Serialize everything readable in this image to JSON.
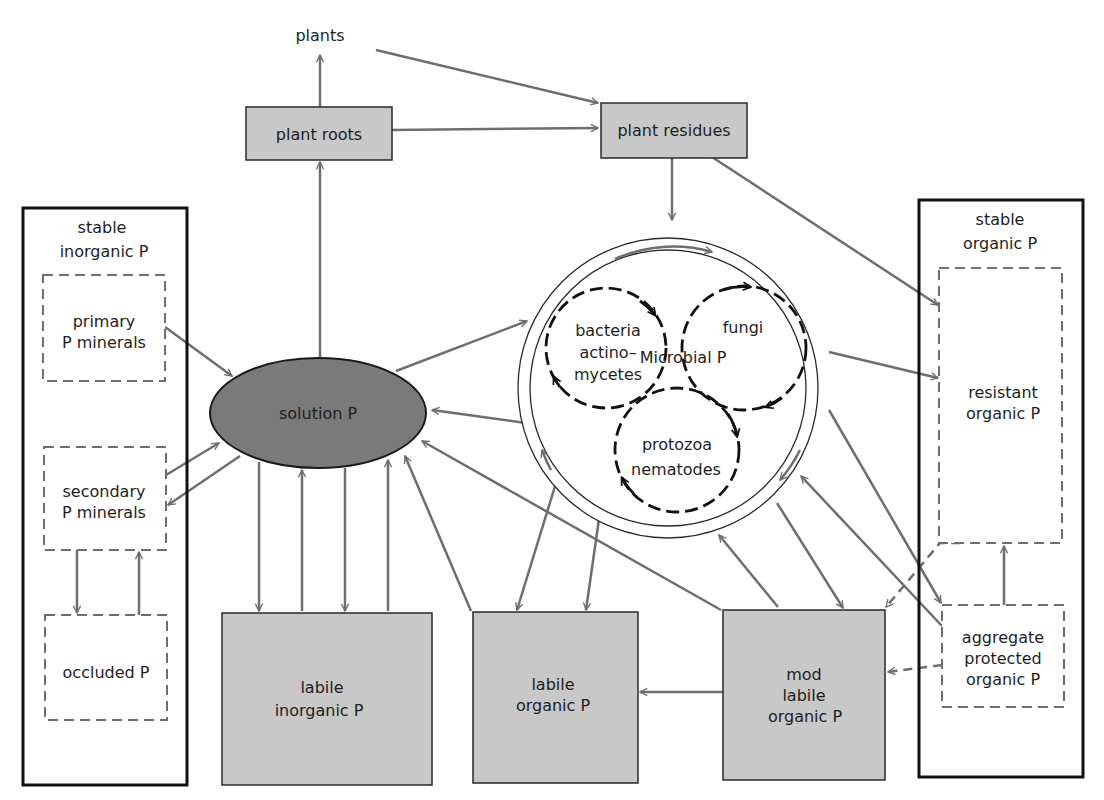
{
  "diagram": {
    "type": "soil phosphorus cycle flow diagram",
    "colors": {
      "pool_fill": "#c8c8c8",
      "solution_fill": "#7a7a7a",
      "arrow": "#6e6e6e",
      "border": "#111111"
    },
    "nodes": {
      "plants": {
        "label": "plants"
      },
      "plant_roots": {
        "label": "plant roots"
      },
      "plant_residues": {
        "label": "plant residues"
      },
      "stable_inorganic": {
        "line1": "stable",
        "line2": "inorganic P"
      },
      "primary_minerals": {
        "line1": "primary",
        "line2": "P minerals"
      },
      "secondary_minerals": {
        "line1": "secondary",
        "line2": "P minerals"
      },
      "occluded": {
        "label": "occluded P"
      },
      "solution": {
        "label": "solution P"
      },
      "labile_inorganic": {
        "line1": "labile",
        "line2": "inorganic P"
      },
      "labile_organic": {
        "line1": "labile",
        "line2": "organic P"
      },
      "mod_labile_organic": {
        "line1": "mod",
        "line2": "labile",
        "line3": "organic P"
      },
      "stable_organic": {
        "line1": "stable",
        "line2": "organic P"
      },
      "resistant_organic": {
        "line1": "resistant",
        "line2": "organic P"
      },
      "aggregate_protected": {
        "line1": "aggregate",
        "line2": "protected",
        "line3": "organic P"
      },
      "microbial": {
        "label": "Microbial P",
        "bacteria": {
          "line1": "bacteria",
          "line2": "actino–",
          "line3": "mycetes"
        },
        "fungi": {
          "label": "fungi"
        },
        "protozoa": {
          "line1": "protozoa",
          "line2": "nematodes"
        }
      }
    },
    "edges": [
      {
        "from": "plant roots",
        "to": "plants"
      },
      {
        "from": "plants",
        "to": "plant residues"
      },
      {
        "from": "plant roots",
        "to": "plant residues"
      },
      {
        "from": "solution P",
        "to": "plant roots"
      },
      {
        "from": "plant residues",
        "to": "Microbial P"
      },
      {
        "from": "plant residues",
        "to": "resistant organic P"
      },
      {
        "from": "primary P minerals",
        "to": "solution P"
      },
      {
        "from": "secondary P minerals",
        "to": "solution P"
      },
      {
        "from": "solution P",
        "to": "secondary P minerals"
      },
      {
        "from": "secondary P minerals",
        "to": "occluded P"
      },
      {
        "from": "occluded P",
        "to": "secondary P minerals"
      },
      {
        "from": "solution P",
        "to": "labile inorganic P"
      },
      {
        "from": "labile inorganic P",
        "to": "solution P"
      },
      {
        "from": "solution P",
        "to": "Microbial P"
      },
      {
        "from": "Microbial P",
        "to": "solution P"
      },
      {
        "from": "labile organic P",
        "to": "solution P"
      },
      {
        "from": "mod labile organic P",
        "to": "solution P"
      },
      {
        "from": "Microbial P",
        "to": "labile organic P"
      },
      {
        "from": "Microbial P",
        "to": "mod labile organic P"
      },
      {
        "from": "mod labile organic P",
        "to": "Microbial P"
      },
      {
        "from": "Microbial P",
        "to": "resistant organic P"
      },
      {
        "from": "Microbial P",
        "to": "aggregate protected organic P"
      },
      {
        "from": "aggregate protected organic P",
        "to": "Microbial P"
      },
      {
        "from": "mod labile organic P",
        "to": "labile organic P"
      },
      {
        "from": "aggregate protected organic P",
        "to": "resistant organic P"
      },
      {
        "from": "aggregate protected organic P",
        "to": "mod labile organic P",
        "style": "dashed"
      },
      {
        "from": "resistant organic P",
        "to": "mod labile organic P",
        "style": "dashed"
      }
    ]
  }
}
